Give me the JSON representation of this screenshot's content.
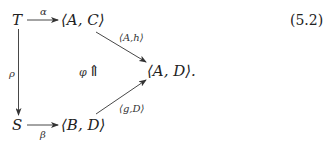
{
  "equation_number": "(5.2)",
  "nodes": {
    "T": "T",
    "AC": "⟨A, C⟩",
    "AD": "⟨A, D⟩.",
    "S": "S",
    "BD": "⟨B, D⟩"
  },
  "arrows": {
    "alpha": {
      "label": "α",
      "from": "T",
      "to": "⟨A, C⟩"
    },
    "rho": {
      "label": "ρ",
      "from": "T",
      "to": "S"
    },
    "beta": {
      "label": "β",
      "from": "S",
      "to": "⟨B, D⟩"
    },
    "Ah": {
      "label": "⟨A,h⟩",
      "from": "⟨A, C⟩",
      "to": "⟨A, D⟩"
    },
    "gD": {
      "label": "⟨g,D⟩",
      "from": "⟨B, D⟩",
      "to": "⟨A, D⟩"
    }
  },
  "two_cell": {
    "label": "φ",
    "symbol": "⇑"
  }
}
